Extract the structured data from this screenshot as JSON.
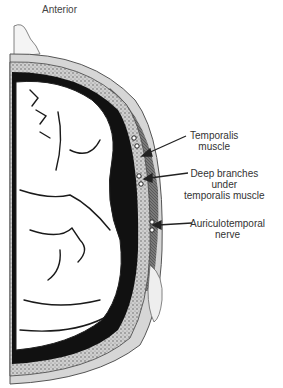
{
  "diagram": {
    "title": "Anterior",
    "labels": [
      {
        "id": "temporalis-muscle",
        "lines": [
          "Temporalis",
          "muscle"
        ]
      },
      {
        "id": "deep-branches",
        "lines": [
          "Deep branches",
          "under",
          "temporalis muscle"
        ]
      },
      {
        "id": "auriculotemporal-nerve",
        "lines": [
          "Auriculotemporal",
          "nerve"
        ]
      }
    ]
  }
}
